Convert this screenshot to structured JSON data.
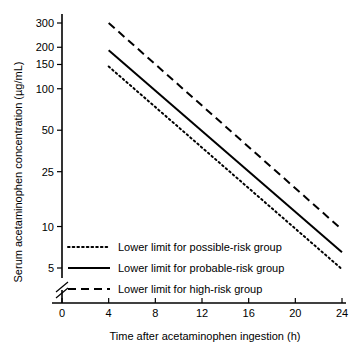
{
  "chart_data": {
    "type": "line",
    "title": "",
    "xlabel": "Time after acetaminophen ingestion (h)",
    "ylabel": "Serum acetaminophen concentration (µg/mL)",
    "xlim": [
      0,
      24
    ],
    "ylim": [
      5,
      300
    ],
    "yscale": "log",
    "xscale": "linear",
    "grid": false,
    "axis_break": true,
    "axis_break_note": "y-axis broken between 5 and 0",
    "xticks": [
      0,
      4,
      8,
      12,
      16,
      20,
      24
    ],
    "xtick_labels": [
      "0",
      "4",
      "8",
      "12",
      "16",
      "20",
      "24"
    ],
    "yticks": [
      5,
      10,
      25,
      50,
      100,
      150,
      200,
      300
    ],
    "ytick_labels": [
      "5",
      "10",
      "25",
      "50",
      "100",
      "150",
      "200",
      "300"
    ],
    "legend_position": "lower left inside axes",
    "series": [
      {
        "name": "Lower limit for possible-risk group",
        "style": "dotted",
        "x": [
          4,
          24
        ],
        "values": [
          145,
          4.9
        ]
      },
      {
        "name": "Lower limit for probable-risk group",
        "style": "solid",
        "x": [
          4,
          24
        ],
        "values": [
          190,
          6.5
        ]
      },
      {
        "name": "Lower limit for high-risk group",
        "style": "dashed",
        "x": [
          4,
          24
        ],
        "values": [
          300,
          9.5
        ]
      }
    ]
  },
  "legend": {
    "items": [
      {
        "label": "Lower limit for possible-risk group",
        "style": "dotted"
      },
      {
        "label": "Lower limit for probable-risk group",
        "style": "solid"
      },
      {
        "label": "Lower limit for high-risk group",
        "style": "dashed"
      }
    ]
  },
  "colors": {
    "ink": "#000000",
    "background": "#ffffff"
  }
}
